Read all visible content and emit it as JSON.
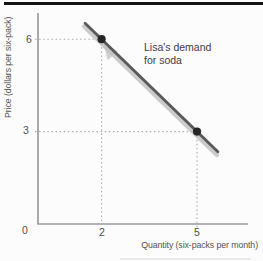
{
  "chart_data": {
    "type": "line",
    "title": "",
    "xlabel": "Quantity (six-packs per month)",
    "ylabel": "Price (dollars per six-pack)",
    "xlim": [
      0,
      6.6
    ],
    "ylim": [
      0,
      6.9
    ],
    "xtick_labels": [
      "0",
      "2",
      "5"
    ],
    "ytick_labels": [
      "0",
      "3",
      "6"
    ],
    "grid": "dotted guide lines from each data point to both axes",
    "legend": "none",
    "annotation": {
      "lines": [
        "Lisa's demand",
        "for soda"
      ]
    },
    "axis_color": "#9b9b9b",
    "guide_color": "#ababab",
    "point_color": "#262626",
    "series": [
      {
        "name": "Lisa's demand for soda",
        "points": [
          {
            "x": 2,
            "y": 6
          },
          {
            "x": 5,
            "y": 3
          }
        ],
        "color": "#5a5a5a",
        "shadow_color": "#c3c3c3",
        "extension_px": {
          "before": 23,
          "after": 29
        }
      }
    ]
  }
}
